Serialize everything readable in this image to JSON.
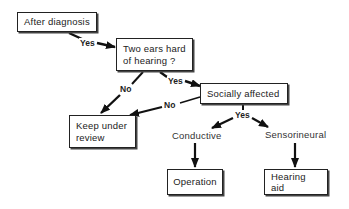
{
  "diagram": {
    "type": "flowchart",
    "nodes": {
      "after_diagnosis": "After diagnosis",
      "two_ears": "Two ears hard of hearing ?",
      "two_ears_line1": "Two ears hard",
      "two_ears_line2": "of hearing ?",
      "socially_affected": "Socially affected",
      "keep_review": "Keep under review",
      "keep_review_line1": "Keep under",
      "keep_review_line2": "review",
      "conductive": "Conductive",
      "sensorineural": "Sensorineural",
      "operation": "Operation",
      "hearing_aid": "Hearing aid"
    },
    "edge_labels": {
      "after_to_two_ears": "Yes",
      "two_ears_to_keep": "No",
      "two_ears_to_social": "Yes",
      "social_to_keep": "No",
      "social_to_types": "Yes"
    },
    "edges": [
      {
        "from": "After diagnosis",
        "to": "Two ears hard of hearing ?",
        "label": "Yes"
      },
      {
        "from": "Two ears hard of hearing ?",
        "to": "Keep under review",
        "label": "No"
      },
      {
        "from": "Two ears hard of hearing ?",
        "to": "Socially affected",
        "label": "Yes"
      },
      {
        "from": "Socially affected",
        "to": "Keep under review",
        "label": "No"
      },
      {
        "from": "Socially affected",
        "to": "Conductive",
        "label": "Yes"
      },
      {
        "from": "Socially affected",
        "to": "Sensorineural",
        "label": "Yes"
      },
      {
        "from": "Conductive",
        "to": "Operation",
        "label": ""
      },
      {
        "from": "Sensorineural",
        "to": "Hearing aid",
        "label": ""
      }
    ]
  }
}
